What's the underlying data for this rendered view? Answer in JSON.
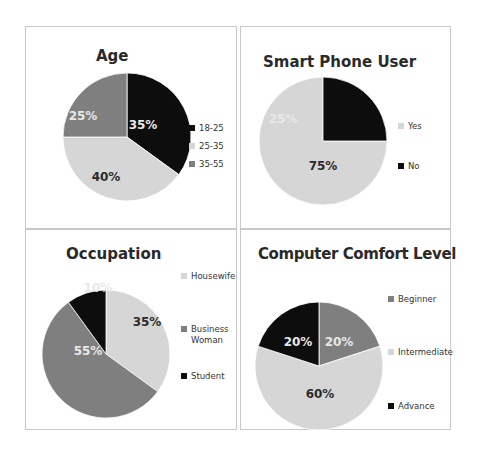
{
  "colors": {
    "black": "#0d0d0d",
    "light": "#d6d6d6",
    "mid": "#7f7f7f",
    "label_dark": "#2b2b2b",
    "label_light": "#e8e8e8"
  },
  "chart_data": [
    {
      "type": "pie",
      "title": "Age",
      "categories": [
        "18-25",
        "25-35",
        "35-55"
      ],
      "values": [
        35,
        40,
        25
      ],
      "value_labels": [
        "35%",
        "40%",
        "25%"
      ],
      "colors": [
        "#0d0d0d",
        "#d6d6d6",
        "#7f7f7f"
      ],
      "legend_position": "right"
    },
    {
      "type": "pie",
      "title": "Smart Phone User",
      "categories": [
        "Yes",
        "No"
      ],
      "values": [
        75,
        25
      ],
      "value_labels": [
        "75%",
        "25%"
      ],
      "colors": [
        "#d6d6d6",
        "#0d0d0d"
      ],
      "legend_position": "right"
    },
    {
      "type": "pie",
      "title": "Occupation",
      "categories": [
        "Housewife",
        "Business Woman",
        "Student"
      ],
      "values": [
        35,
        55,
        10
      ],
      "value_labels": [
        "35%",
        "55%",
        "10%"
      ],
      "colors": [
        "#d6d6d6",
        "#7f7f7f",
        "#0d0d0d"
      ],
      "legend_position": "right"
    },
    {
      "type": "pie",
      "title": "Computer Comfort Level",
      "categories": [
        "Beginner",
        "Intermediate",
        "Advance"
      ],
      "values": [
        20,
        60,
        20
      ],
      "value_labels": [
        "20%",
        "60%",
        "20%"
      ],
      "colors": [
        "#7f7f7f",
        "#d6d6d6",
        "#0d0d0d"
      ],
      "legend_position": "right"
    }
  ],
  "panels": {
    "age": {
      "title": "Age",
      "legend": [
        "18-25",
        "25-35",
        "35-55"
      ]
    },
    "phone": {
      "title": "Smart Phone User",
      "legend": [
        "Yes",
        "No"
      ]
    },
    "occupation": {
      "title": "Occupation",
      "legend": [
        "Housewife",
        "Business",
        "Woman",
        "Student"
      ]
    },
    "comfort": {
      "title": "Computer Comfort Level",
      "legend": [
        "Beginner",
        "Intermediate",
        "Advance"
      ]
    }
  }
}
